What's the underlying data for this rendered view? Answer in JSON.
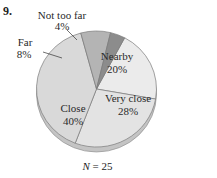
{
  "problem_number": "9.",
  "chart_data": {
    "type": "pie",
    "title": "",
    "categories": [
      "Nearby",
      "Very close",
      "Close",
      "Far",
      "Not too far"
    ],
    "values": [
      20,
      28,
      40,
      8,
      4
    ],
    "value_labels": [
      "20%",
      "28%",
      "40%",
      "8%",
      "4%"
    ],
    "colors": [
      "#ebebeb",
      "#e3e3e3",
      "#d9d9d9",
      "#b4b4b4",
      "#8c8c8c"
    ],
    "start_angle_deg": -62,
    "style": "3d",
    "n_label": "N = 25",
    "n": 25
  },
  "labels": {
    "nearby": {
      "name": "Nearby",
      "pct": "20%"
    },
    "very_close": {
      "name": "Very close",
      "pct": "28%"
    },
    "close": {
      "name": "Close",
      "pct": "40%"
    },
    "far": {
      "name": "Far",
      "pct": "8%"
    },
    "not_too_far": {
      "name": "Not too far",
      "pct": "4%"
    }
  },
  "footer": {
    "n_var": "N",
    "n_rest": " = 25"
  }
}
